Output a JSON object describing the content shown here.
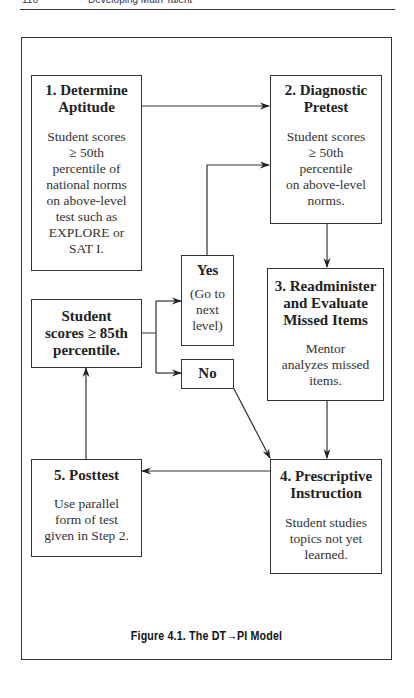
{
  "running_head": {
    "page_number": "116",
    "title": "Developing Math Talent"
  },
  "diagram": {
    "nodes": {
      "step1": {
        "heading": [
          "1. Determine",
          "Aptitude"
        ],
        "body": [
          "Student scores",
          "≥ 50th",
          "percentile of",
          "national norms",
          "on above-level",
          "test such as",
          "EXPLORE or",
          "SAT I."
        ]
      },
      "step2": {
        "heading": [
          "2. Diagnostic",
          "Pretest"
        ],
        "body": [
          "Student scores",
          "≥ 50th",
          "percentile",
          "on above-level",
          "norms."
        ]
      },
      "step3": {
        "heading": [
          "3. Readminister",
          "and Evaluate",
          "Missed Items"
        ],
        "body": [
          "Mentor",
          "analyzes missed",
          "items."
        ]
      },
      "step4": {
        "heading": [
          "4. Prescriptive",
          "Instruction"
        ],
        "body": [
          "Student studies",
          "topics not yet",
          "learned."
        ]
      },
      "step5": {
        "heading": [
          "5. Posttest"
        ],
        "body": [
          "Use parallel",
          "form of test",
          "given in Step 2."
        ]
      },
      "decision": {
        "heading": [
          "Student",
          "scores ≥ 85th",
          "percentile."
        ]
      },
      "yes": {
        "heading": [
          "Yes"
        ],
        "body": [
          "(Go to",
          "next",
          "level)"
        ]
      },
      "no": {
        "heading": [
          "No"
        ]
      }
    },
    "edges": [
      {
        "from": "step1",
        "to": "step2"
      },
      {
        "from": "yes",
        "to": "step2"
      },
      {
        "from": "step2",
        "to": "step3"
      },
      {
        "from": "step3",
        "to": "step4"
      },
      {
        "from": "no",
        "to": "step4"
      },
      {
        "from": "step4",
        "to": "step5"
      },
      {
        "from": "step5",
        "to": "decision"
      },
      {
        "from": "decision",
        "to": "yes"
      },
      {
        "from": "decision",
        "to": "no"
      }
    ],
    "colors": {
      "line": "#333333",
      "text": "#222222",
      "background": "#ffffff"
    }
  },
  "caption": "Figure 4.1. The DT→PI Model"
}
